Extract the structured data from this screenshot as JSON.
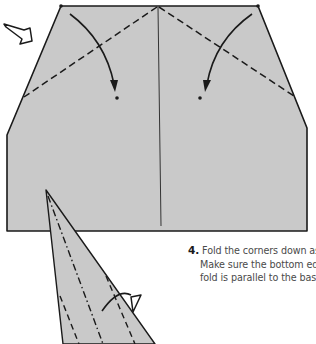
{
  "diagram": {
    "paper_fill": "#c9c9c9",
    "line_color": "#1a1a1a",
    "step": {
      "number": "4.",
      "lines": [
        "Fold the corners down as indicated.",
        "Make sure the bottom edge of this",
        "fold is parallel to the base."
      ]
    },
    "icons": {
      "turn_over_arrow": "hollow-arrow-icon",
      "fold_arrow_left": "curved-fold-arrow-icon",
      "fold_arrow_right": "curved-fold-arrow-icon",
      "reverse_arrow": "hooked-arrow-icon"
    }
  }
}
